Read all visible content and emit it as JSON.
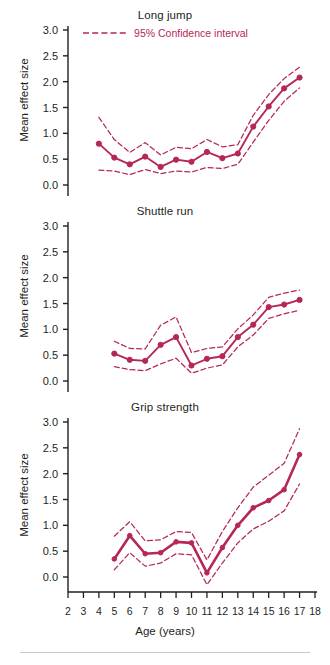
{
  "figure": {
    "xlabel": "Age (years)",
    "ylabel": "Mean effect size",
    "legend_label": "95% Confidence interval",
    "line_color": "#b5275a",
    "axis_color": "#231f20"
  },
  "chart_data": [
    {
      "type": "line",
      "title": "Long jump",
      "xlabel": "Age (years)",
      "ylabel": "Mean effect size",
      "xlim": [
        2,
        18
      ],
      "ylim": [
        0.0,
        3.0
      ],
      "yticks": [
        "0.0",
        "0.5",
        "1.0",
        "1.5",
        "2.0",
        "2.5",
        "3.0"
      ],
      "xticks": [
        "2",
        "3",
        "4",
        "5",
        "6",
        "7",
        "8",
        "9",
        "10",
        "11",
        "12",
        "13",
        "14",
        "15",
        "16",
        "17",
        "18"
      ],
      "grid": false,
      "legend": [
        "95% Confidence interval"
      ],
      "legend_position": "top-center",
      "x": [
        4,
        5,
        6,
        7,
        8,
        9,
        10,
        11,
        12,
        13,
        14,
        15,
        16,
        17
      ],
      "series": [
        {
          "name": "Mean effect size",
          "values": [
            0.8,
            0.53,
            0.4,
            0.55,
            0.35,
            0.49,
            0.45,
            0.64,
            0.52,
            0.61,
            1.13,
            1.52,
            1.87,
            2.08,
            2.21
          ]
        },
        {
          "name": "95% CI upper",
          "values": [
            1.31,
            0.88,
            0.63,
            0.82,
            0.58,
            0.73,
            0.7,
            0.88,
            0.74,
            0.78,
            1.35,
            1.75,
            2.06,
            2.28,
            2.42
          ]
        },
        {
          "name": "95% CI lower",
          "values": [
            0.29,
            0.27,
            0.2,
            0.3,
            0.22,
            0.27,
            0.25,
            0.34,
            0.32,
            0.4,
            0.83,
            1.25,
            1.62,
            1.88,
            2.03
          ]
        }
      ]
    },
    {
      "type": "line",
      "title": "Shuttle run",
      "xlabel": "Age (years)",
      "ylabel": "Mean effect size",
      "xlim": [
        2,
        18
      ],
      "ylim": [
        0.0,
        3.0
      ],
      "yticks": [
        "0.0",
        "0.5",
        "1.0",
        "1.5",
        "2.0",
        "2.5",
        "3.0"
      ],
      "xticks": [
        "2",
        "3",
        "4",
        "5",
        "6",
        "7",
        "8",
        "9",
        "10",
        "11",
        "12",
        "13",
        "14",
        "15",
        "16",
        "17",
        "18"
      ],
      "grid": false,
      "x": [
        5,
        6,
        7,
        8,
        9,
        10,
        11,
        12,
        13,
        14,
        15,
        16,
        17
      ],
      "series": [
        {
          "name": "Mean effect size",
          "values": [
            0.53,
            0.41,
            0.39,
            0.7,
            0.85,
            0.3,
            0.43,
            0.48,
            0.85,
            1.09,
            1.43,
            1.48,
            1.57
          ]
        },
        {
          "name": "95% CI upper",
          "values": [
            0.77,
            0.63,
            0.62,
            1.08,
            1.24,
            0.55,
            0.63,
            0.66,
            1.01,
            1.28,
            1.62,
            1.7,
            1.76
          ]
        },
        {
          "name": "95% CI lower",
          "values": [
            0.28,
            0.22,
            0.2,
            0.33,
            0.44,
            0.15,
            0.25,
            0.31,
            0.66,
            0.89,
            1.21,
            1.3,
            1.37
          ]
        }
      ]
    },
    {
      "type": "line",
      "title": "Grip strength",
      "xlabel": "Age (years)",
      "ylabel": "Mean effect size",
      "xlim": [
        2,
        18
      ],
      "ylim": [
        0.0,
        3.0
      ],
      "yticks": [
        "0.0",
        "0.5",
        "1.0",
        "1.5",
        "2.0",
        "2.5",
        "3.0"
      ],
      "xticks": [
        "2",
        "3",
        "4",
        "5",
        "6",
        "7",
        "8",
        "9",
        "10",
        "11",
        "12",
        "13",
        "14",
        "15",
        "16",
        "17",
        "18"
      ],
      "grid": false,
      "x": [
        5,
        6,
        7,
        8,
        9,
        10,
        11,
        12,
        13,
        14,
        15,
        16,
        17
      ],
      "series": [
        {
          "name": "Mean effect size",
          "values": [
            0.35,
            0.8,
            0.45,
            0.47,
            0.68,
            0.66,
            0.08,
            0.57,
            1.0,
            1.34,
            1.48,
            1.69,
            2.37
          ]
        },
        {
          "name": "95% CI upper",
          "values": [
            0.79,
            1.07,
            0.7,
            0.72,
            0.88,
            0.86,
            0.33,
            0.88,
            1.34,
            1.74,
            1.97,
            2.2,
            2.87
          ]
        },
        {
          "name": "95% CI lower",
          "values": [
            0.14,
            0.47,
            0.21,
            0.27,
            0.45,
            0.43,
            -0.15,
            0.27,
            0.66,
            0.93,
            1.08,
            1.28,
            1.8
          ]
        }
      ]
    }
  ]
}
